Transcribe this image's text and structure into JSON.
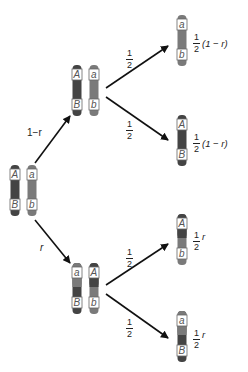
{
  "colors": {
    "dark_chromosome": "#444444",
    "light_chromosome": "#7a7a7a",
    "arrow": "#111111",
    "label_box_fill": "#ffffff",
    "label_box_stroke": "#555555",
    "allele_text": "#555555"
  },
  "parent": {
    "chromosomes": [
      {
        "top": "A",
        "bottom": "B",
        "shade": "dark"
      },
      {
        "top": "a",
        "bottom": "b",
        "shade": "light"
      }
    ]
  },
  "branches": {
    "no_crossover": {
      "label": "1−r",
      "pair": [
        {
          "top": "A",
          "bottom": "B",
          "shade": "dark"
        },
        {
          "top": "a",
          "bottom": "b",
          "shade": "light"
        }
      ]
    },
    "crossover": {
      "label": "r",
      "pair": [
        {
          "top": "a",
          "bottom": "B",
          "shade": "light-top-dark-bottom"
        },
        {
          "top": "A",
          "bottom": "b",
          "shade": "dark-top-light-bottom"
        }
      ]
    }
  },
  "segregation_fraction": {
    "num": "1",
    "den": "2"
  },
  "gametes": [
    {
      "top": "a",
      "bottom": "b",
      "shade": "light",
      "prob_num": "1",
      "prob_den": "2",
      "prob_tail": "(1 − r)"
    },
    {
      "top": "A",
      "bottom": "B",
      "shade": "dark",
      "prob_num": "1",
      "prob_den": "2",
      "prob_tail": "(1 − r)"
    },
    {
      "top": "A",
      "bottom": "b",
      "shade": "dark-top-light-bottom",
      "prob_num": "1",
      "prob_den": "2",
      "prob_tail": "r"
    },
    {
      "top": "a",
      "bottom": "B",
      "shade": "light-top-dark-bottom",
      "prob_num": "1",
      "prob_den": "2",
      "prob_tail": "r"
    }
  ]
}
